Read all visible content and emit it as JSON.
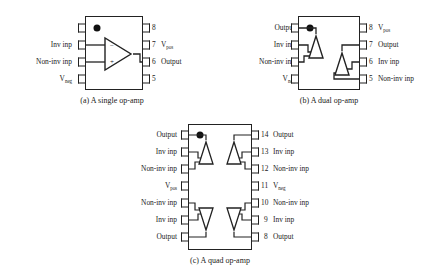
{
  "figure": {
    "background_color": "#ffffff",
    "line_color": "#222222",
    "text_color": "#1a1a1a"
  },
  "packages": [
    {
      "id": "single",
      "caption": "(a) A single op-amp",
      "pin_count": 8,
      "amp_count": 1,
      "orientation_marker": "dot",
      "left_pins": [
        {
          "number": "1",
          "label": ""
        },
        {
          "number": "2",
          "label": "Inv inp"
        },
        {
          "number": "3",
          "label": "Non-inv inp"
        },
        {
          "number": "4",
          "label": "V",
          "sub": "neg"
        }
      ],
      "right_pins": [
        {
          "number": "8",
          "label": ""
        },
        {
          "number": "7",
          "label": "V",
          "sub": "pos"
        },
        {
          "number": "6",
          "label": "Output"
        },
        {
          "number": "5",
          "label": ""
        }
      ],
      "amp_symbols": [
        {
          "direction": "right",
          "minus_pin": "2",
          "plus_pin": "3",
          "out_pin": "6"
        }
      ]
    },
    {
      "id": "dual",
      "caption": "(b) A dual op-amp",
      "pin_count": 8,
      "amp_count": 2,
      "orientation_marker": "dot",
      "left_pins": [
        {
          "number": "1",
          "label": "Output"
        },
        {
          "number": "2",
          "label": "Inv inp"
        },
        {
          "number": "3",
          "label": "Non-inv inp"
        },
        {
          "number": "4",
          "label": "V",
          "sub": "neg"
        }
      ],
      "right_pins": [
        {
          "number": "8",
          "label": "V",
          "sub": "pos"
        },
        {
          "number": "7",
          "label": "Output"
        },
        {
          "number": "6",
          "label": "Inv inp"
        },
        {
          "number": "5",
          "label": "Non-inv inp"
        }
      ],
      "amp_symbols": [
        {
          "direction": "up",
          "position": "upper-left"
        },
        {
          "direction": "up",
          "position": "lower-right"
        }
      ]
    },
    {
      "id": "quad",
      "caption": "(c) A quad op-amp",
      "pin_count": 14,
      "amp_count": 4,
      "orientation_marker": "dot",
      "left_pins": [
        {
          "number": "1",
          "label": "Output"
        },
        {
          "number": "2",
          "label": "Inv inp"
        },
        {
          "number": "3",
          "label": "Non-inv inp"
        },
        {
          "number": "4",
          "label": "V",
          "sub": "pos"
        },
        {
          "number": "5",
          "label": "Non-inv inp"
        },
        {
          "number": "6",
          "label": "Inv inp"
        },
        {
          "number": "7",
          "label": "Output"
        }
      ],
      "right_pins": [
        {
          "number": "14",
          "label": "Output"
        },
        {
          "number": "13",
          "label": "Inv inp"
        },
        {
          "number": "12",
          "label": "Non-inv inp"
        },
        {
          "number": "11",
          "label": "V",
          "sub": "neg"
        },
        {
          "number": "10",
          "label": "Non-inv inp"
        },
        {
          "number": "9",
          "label": "Inv inp"
        },
        {
          "number": "8",
          "label": "Output"
        }
      ],
      "amp_symbols": [
        {
          "direction": "up",
          "position": "top-left"
        },
        {
          "direction": "up",
          "position": "top-right"
        },
        {
          "direction": "down",
          "position": "bottom-left"
        },
        {
          "direction": "down",
          "position": "bottom-right"
        }
      ]
    }
  ]
}
